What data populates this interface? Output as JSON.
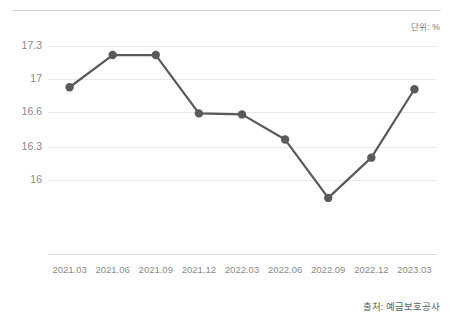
{
  "labels": {
    "unit": "단위: %",
    "source": "출처: 예금보호공사"
  },
  "colors": {
    "line": "#595959",
    "marker": "#5a5a5a",
    "grid": "#e9e9e9",
    "rule": "#d2d2d2",
    "tick_text": "#8a8a8a"
  },
  "chart_data": {
    "type": "line",
    "title": "",
    "subtitle": "",
    "xlabel": "",
    "ylabel": "",
    "unit": "%",
    "source": "출처: 예금보호공사",
    "grid": true,
    "legend": false,
    "legend_position": "none",
    "categories": [
      "2021.03",
      "2021.06",
      "2021.09",
      "2021.12",
      "2022.03",
      "2022.06",
      "2022.09",
      "2022.12",
      "2023.03"
    ],
    "values": [
      16.92,
      17.24,
      17.24,
      16.66,
      16.65,
      16.4,
      15.82,
      16.22,
      16.9
    ],
    "ytick_labels": [
      "17.3",
      "17",
      "16.6",
      "16.3",
      "16"
    ],
    "ytick_values": [
      17.33,
      17.0,
      16.67,
      16.33,
      16.0
    ],
    "ylim": [
      15.67,
      17.33
    ],
    "markers": true,
    "series": [
      {
        "name": "",
        "values": [
          16.92,
          17.24,
          17.24,
          16.66,
          16.65,
          16.4,
          15.82,
          16.22,
          16.9
        ]
      }
    ]
  }
}
